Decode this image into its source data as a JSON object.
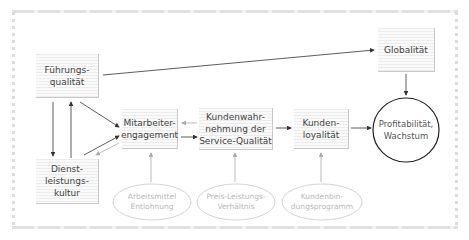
{
  "diagram": {
    "nodes": {
      "fuehrungsqualitaet": {
        "label": "Führungs-\nqualität"
      },
      "dienstleistungskultur": {
        "label": "Dienst-\nleistungs-\nkultur"
      },
      "mitarbeiterengagement": {
        "label": "Mitarbeiter-\nengagement"
      },
      "kundenwahrnehmung": {
        "label": "Kundenwahr-\nnehmung der\nService-Qualität"
      },
      "kundenloyalitaet": {
        "label": "Kunden-\nloyalität"
      },
      "globalitaet": {
        "label": "Globalität"
      },
      "profitabilitaet": {
        "label": "Profitabilität,\nWachstum"
      }
    },
    "influencers": {
      "arbeitsmittel": {
        "label": "Arbeitsmittel\nEntlohnung"
      },
      "preis_leistung": {
        "label": "Preis-Leistungs-\nVerhältnis"
      },
      "kundenbindung": {
        "label": "Kundenbin-\ndungsprogramm"
      }
    },
    "edges": [
      {
        "from": "Führungsqualität",
        "to": "Globalität"
      },
      {
        "from": "Globalität",
        "to": "Profitabilität, Wachstum"
      },
      {
        "from": "Führungsqualität",
        "to": "Dienstleistungskultur"
      },
      {
        "from": "Dienstleistungskultur",
        "to": "Führungsqualität"
      },
      {
        "from": "Führungsqualität",
        "to": "Mitarbeiterengagement"
      },
      {
        "from": "Dienstleistungskultur",
        "to": "Mitarbeiterengagement"
      },
      {
        "from": "Mitarbeiterengagement",
        "to": "Dienstleistungskultur",
        "style": "faint"
      },
      {
        "from": "Mitarbeiterengagement",
        "to": "Kundenwahrnehmung der Service-Qualität"
      },
      {
        "from": "Kundenwahrnehmung der Service-Qualität",
        "to": "Mitarbeiterengagement",
        "style": "faint"
      },
      {
        "from": "Kundenwahrnehmung der Service-Qualität",
        "to": "Kundenloyalität"
      },
      {
        "from": "Kundenloyalität",
        "to": "Profitabilität, Wachstum"
      },
      {
        "from": "Arbeitsmittel Entlohnung",
        "to": "Mitarbeiterengagement",
        "style": "faint"
      },
      {
        "from": "Preis-Leistungs-Verhältnis",
        "to": "Kundenwahrnehmung der Service-Qualität",
        "style": "faint"
      },
      {
        "from": "Kundenbindungsprogramm",
        "to": "Kundenloyalität",
        "style": "faint"
      }
    ],
    "colors": {
      "arrow": "#333333",
      "faint_arrow": "#aaaaaa",
      "ellipse_faint": "#c8c8c8",
      "ellipse_main": "#222222"
    }
  }
}
